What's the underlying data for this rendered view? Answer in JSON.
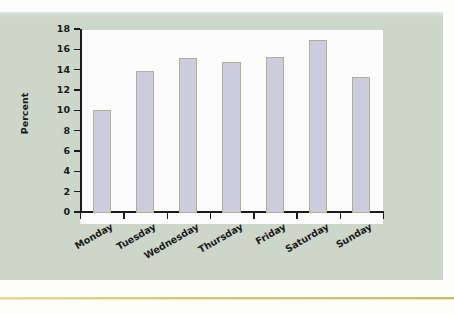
{
  "chart_data": {
    "type": "bar",
    "title": "",
    "subtitle": "",
    "xlabel": "",
    "ylabel": "Percent",
    "categories": [
      "Monday",
      "Tuesday",
      "Wednesday",
      "Thursday",
      "Friday",
      "Saturday",
      "Sunday"
    ],
    "values": [
      10.1,
      14.0,
      15.2,
      14.9,
      15.3,
      17.0,
      13.4
    ],
    "ylim": [
      0,
      18
    ],
    "ytick_labels": [
      "0",
      "2",
      "4",
      "6",
      "8",
      "10",
      "12",
      "14",
      "16",
      "18"
    ],
    "ytick_values": [
      0,
      2,
      4,
      6,
      8,
      10,
      12,
      14,
      16,
      18
    ],
    "ytick_step": 2,
    "grid": false,
    "legend": null,
    "legend_position": "none",
    "annotations": [],
    "series": [
      {
        "name": "Percent",
        "values": [
          10.1,
          14.0,
          15.2,
          14.9,
          15.3,
          17.0,
          13.4
        ]
      }
    ]
  },
  "style": {
    "panel_background": "#ccd6c9",
    "plot_background": "#fbfbfb",
    "bar_fill": "#ccccdf",
    "bar_border": "#b5ae8e",
    "axis_color": "#1c1c1c",
    "text_color": "#1a1a1a",
    "rule_color": "#d9c96b",
    "page_background": "#fdfdfc"
  }
}
